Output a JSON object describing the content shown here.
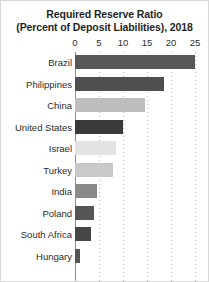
{
  "chart_data": {
    "type": "bar",
    "orientation": "horizontal",
    "title": "Required Reserve Ratio",
    "subtitle": "(Percent of Deposit Liabilities), 2018",
    "title_lines": [
      "Required Reserve Ratio",
      "(Percent of Deposit Liabilities), 2018"
    ],
    "xlabel": "",
    "ylabel": "",
    "xlim": [
      0,
      25
    ],
    "xticks": [
      0,
      5,
      10,
      15,
      20,
      25
    ],
    "xtick_labels": [
      "0",
      "5",
      "10",
      "15",
      "20",
      "25"
    ],
    "grid": true,
    "grid_axis": "x",
    "legend": false,
    "categories": [
      "Brazil",
      "Philippines",
      "China",
      "United States",
      "Israel",
      "Turkey",
      "India",
      "Poland",
      "South Africa",
      "Hungary"
    ],
    "values": [
      25,
      18.5,
      14.5,
      10,
      8.5,
      8,
      4.5,
      4,
      3.3,
      1
    ],
    "bars": [
      {
        "label": "Brazil",
        "value": 25,
        "color": "#585858"
      },
      {
        "label": "Philippines",
        "value": 18.5,
        "color": "#4f4f4f"
      },
      {
        "label": "China",
        "value": 14.5,
        "color": "#bdbdbd"
      },
      {
        "label": "United States",
        "value": 10,
        "color": "#3a3a3a"
      },
      {
        "label": "Israel",
        "value": 8.5,
        "color": "#e3e3e3"
      },
      {
        "label": "Turkey",
        "value": 8,
        "color": "#c9c9c9"
      },
      {
        "label": "India",
        "value": 4.5,
        "color": "#8a8a8a"
      },
      {
        "label": "Poland",
        "value": 4,
        "color": "#555555"
      },
      {
        "label": "South Africa",
        "value": 3.3,
        "color": "#464646"
      },
      {
        "label": "Hungary",
        "value": 1,
        "color": "#555555"
      }
    ]
  },
  "colors": {
    "background": "#ffffff",
    "text": "#2b2b2b",
    "axis": "#8c8c8c",
    "gridline": "#bdbdbd",
    "border": "#d8d8d8"
  }
}
